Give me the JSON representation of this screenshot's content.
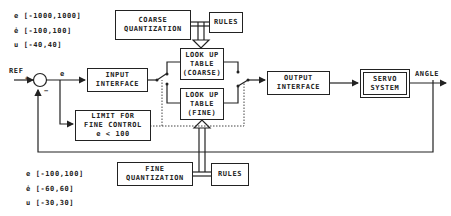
{
  "coarse_ranges": {
    "e": "e [-1000,1000]",
    "e_dot": "ė [-100,100]",
    "u": "u [-40,40]"
  },
  "fine_ranges": {
    "e": "e [-100,100]",
    "e_dot": "ė [-60,60]",
    "u": "u [-30,30]"
  },
  "blocks": {
    "coarse_quantization": [
      "COARSE",
      "QUANTIZATION"
    ],
    "rules_top": "RULES",
    "lut_coarse": [
      "LOOK UP",
      "TABLE",
      "(COARSE)"
    ],
    "lut_fine": [
      "LOOK UP",
      "TABLE",
      "(FINE)"
    ],
    "input_interface": [
      "INPUT",
      "INTERFACE"
    ],
    "limit_fine_control": [
      "LIMIT FOR",
      "FINE CONTROL",
      "e < 100"
    ],
    "output_interface": [
      "OUTPUT",
      "INTERFACE"
    ],
    "servo_system": [
      "SERVO",
      "SYSTEM"
    ],
    "fine_quantization": [
      "FINE",
      "QUANTIZATION"
    ],
    "rules_bottom": "RULES"
  },
  "signals": {
    "ref": "REF",
    "error": "e",
    "angle": "ANGLE",
    "plus": "+",
    "minus": "−"
  }
}
